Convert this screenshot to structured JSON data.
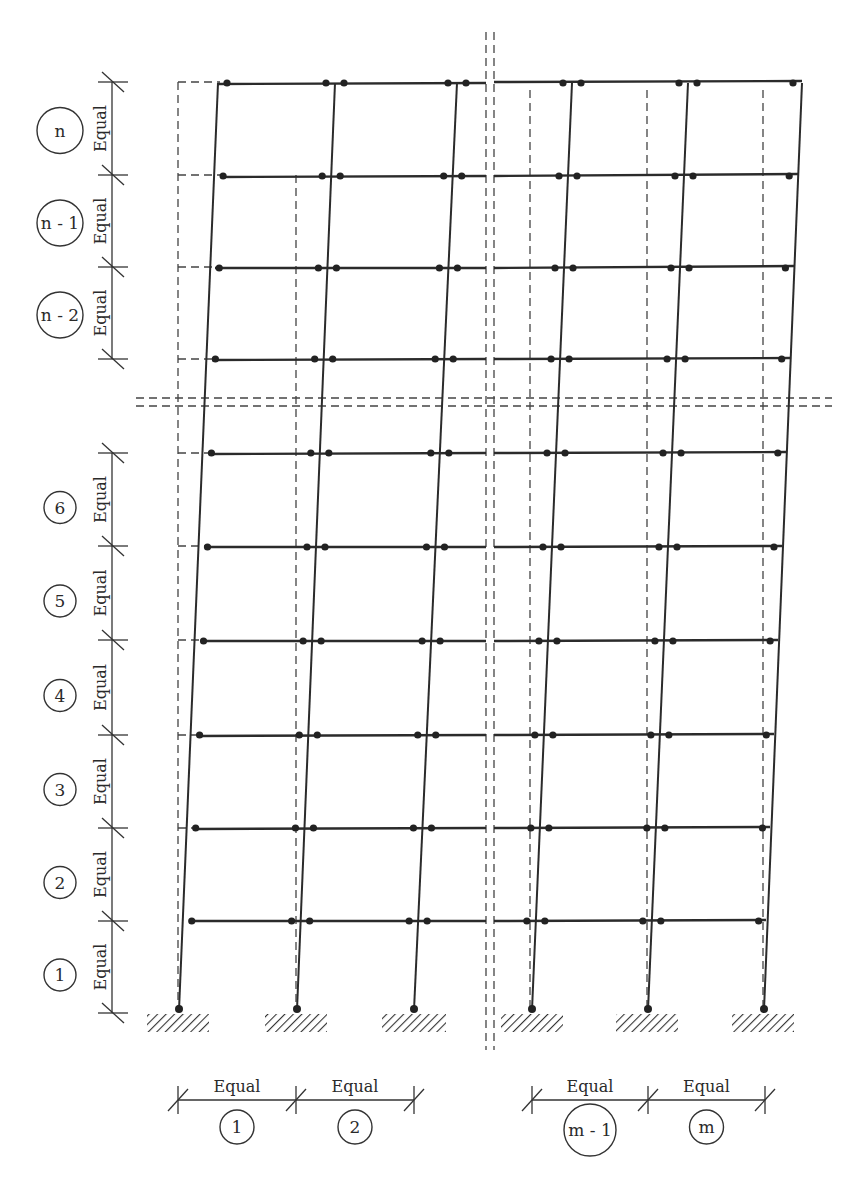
{
  "diagram": {
    "colors": {
      "line": "#2b2b2b",
      "background": "#ffffff"
    },
    "story_labels": [
      {
        "id": "n",
        "label": "n",
        "dim": "Equal"
      },
      {
        "id": "n-1",
        "label": "n - 1",
        "dim": "Equal"
      },
      {
        "id": "n-2",
        "label": "n - 2",
        "dim": "Equal"
      },
      {
        "id": "6",
        "label": "6",
        "dim": "Equal"
      },
      {
        "id": "5",
        "label": "5",
        "dim": "Equal"
      },
      {
        "id": "4",
        "label": "4",
        "dim": "Equal"
      },
      {
        "id": "3",
        "label": "3",
        "dim": "Equal"
      },
      {
        "id": "2",
        "label": "2",
        "dim": "Equal"
      },
      {
        "id": "1",
        "label": "1",
        "dim": "Equal"
      }
    ],
    "bay_labels": [
      {
        "id": "1",
        "label": "1",
        "dim": "Equal"
      },
      {
        "id": "2",
        "label": "2",
        "dim": "Equal"
      },
      {
        "id": "m-1",
        "label": "m - 1",
        "dim": "Equal"
      },
      {
        "id": "m",
        "label": "m",
        "dim": "Equal"
      }
    ],
    "supports": [
      "fixed",
      "fixed",
      "fixed",
      "fixed",
      "fixed",
      "fixed"
    ],
    "break_lines": [
      "vertical-break",
      "horizontal-break"
    ]
  }
}
